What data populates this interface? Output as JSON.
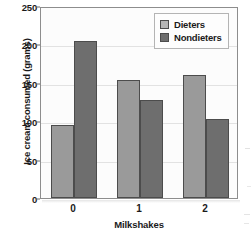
{
  "chart_data": {
    "type": "bar",
    "title": "",
    "xlabel": "Milkshakes",
    "ylabel": "Ice cream consumed (grams)",
    "categories": [
      "0",
      "1",
      "2"
    ],
    "series": [
      {
        "name": "Dieters",
        "color": "#9a9a9a",
        "values": [
          95,
          154,
          160
        ]
      },
      {
        "name": "Nondieters",
        "color": "#6e6e6e",
        "values": [
          204,
          128,
          103
        ]
      }
    ],
    "ylim": [
      0,
      250
    ],
    "yticks": [
      0,
      50,
      100,
      150,
      200,
      250
    ],
    "ytick_labels": [
      "0",
      "50",
      "100",
      "150",
      "200",
      "250"
    ],
    "grid": true,
    "legend_position": "top-right"
  },
  "legend": {
    "items": [
      {
        "label": "Dieters"
      },
      {
        "label": "Nondieters"
      }
    ]
  }
}
